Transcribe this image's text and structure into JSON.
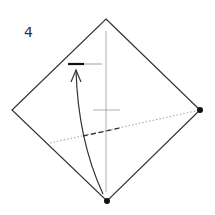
{
  "diagram": {
    "type": "origami-step",
    "step_number": "4",
    "colors": {
      "line": "#333333",
      "guide": "#888888",
      "dot": "#111111"
    }
  }
}
